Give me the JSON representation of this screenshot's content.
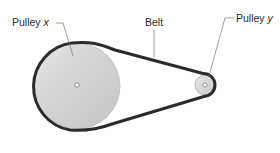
{
  "diagram": {
    "type": "belt-and-pulley",
    "labels": {
      "pulley_x": {
        "text": "Pulley",
        "variable": "x"
      },
      "belt": {
        "text": "Belt"
      },
      "pulley_y": {
        "text": "Pulley",
        "variable": "y"
      }
    },
    "components": {
      "pulley_x": {
        "size": "large",
        "fill": "#d9d9d9"
      },
      "pulley_y": {
        "size": "small",
        "fill": "#d9d9d9"
      },
      "belt": {
        "color": "#2b2b2b"
      }
    }
  }
}
